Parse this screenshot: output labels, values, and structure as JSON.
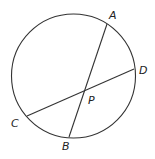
{
  "diagram": {
    "type": "circle-intersecting-chords",
    "circle": {
      "cx": 73.5,
      "cy": 76,
      "r": 62
    },
    "points": {
      "A": {
        "x": 107,
        "y": 24,
        "label": "A",
        "lx": 109,
        "ly": 19
      },
      "B": {
        "x": 69,
        "y": 137,
        "label": "B",
        "lx": 62,
        "ly": 150
      },
      "C": {
        "x": 27,
        "y": 116,
        "label": "C",
        "lx": 11,
        "ly": 127
      },
      "D": {
        "x": 134,
        "y": 69,
        "label": "D",
        "lx": 139,
        "ly": 74
      },
      "P": {
        "x": 84,
        "y": 91,
        "label": "P",
        "lx": 88,
        "ly": 104
      }
    },
    "chords": [
      [
        "A",
        "B"
      ],
      [
        "C",
        "D"
      ]
    ],
    "stroke_color": "#333333"
  }
}
